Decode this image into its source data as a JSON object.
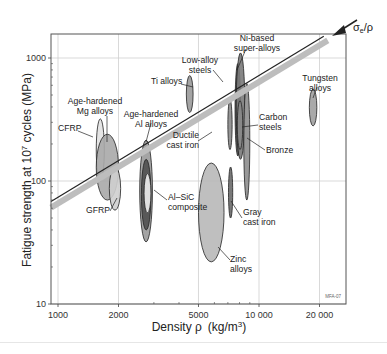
{
  "chart_data": {
    "type": "bubble-ellipse",
    "title": "",
    "xlabel": "Density ρ  (kg/m³)",
    "ylabel": "Fatigue strength at 10⁷ cycles (MPa)",
    "x_scale": "log",
    "y_scale": "log",
    "xlim": [
      900,
      26000
    ],
    "ylim": [
      10,
      1800
    ],
    "x_ticks": [
      {
        "value": 1000,
        "label": "1000"
      },
      {
        "value": 2000,
        "label": "2000"
      },
      {
        "value": 5000,
        "label": "5000"
      },
      {
        "value": 10000,
        "label": "10 000"
      },
      {
        "value": 20000,
        "label": "20 000"
      }
    ],
    "y_ticks": [
      {
        "value": 10,
        "label": "10"
      },
      {
        "value": 100,
        "label": "100"
      },
      {
        "value": 1000,
        "label": "1000"
      }
    ],
    "grid": true,
    "guide_line": {
      "label": "σe/ρ",
      "slope": 1,
      "points": [
        [
          930,
          68
        ],
        [
          21000,
          1500
        ]
      ]
    },
    "watermark": "MFA 07",
    "ellipses": [
      {
        "name": "CFRP",
        "x": [
          1550,
          1700
        ],
        "y": [
          100,
          320
        ],
        "fill": "#e2e2e2"
      },
      {
        "name": "Age-hardened Mg alloys",
        "x": [
          1550,
          2000
        ],
        "y": [
          70,
          240
        ],
        "fill": "#a8a8a8"
      },
      {
        "name": "GFRP",
        "x": [
          1800,
          2050
        ],
        "y": [
          58,
          130
        ],
        "fill": "#cfcfcf"
      },
      {
        "name": "Age-hardened Al alloys",
        "x": [
          2550,
          2950
        ],
        "y": [
          32,
          215
        ],
        "fill": "#9a9a9a"
      },
      {
        "name": "Al alloys (core)",
        "x": [
          2600,
          2900
        ],
        "y": [
          40,
          150
        ],
        "fill": "#505050"
      },
      {
        "name": "Al-SiC composite",
        "x": [
          2680,
          2900
        ],
        "y": [
          55,
          115
        ],
        "fill": "#f0f0f0"
      },
      {
        "name": "Ti alloys",
        "x": [
          4350,
          4700
        ],
        "y": [
          360,
          720
        ],
        "fill": "#9a9a9a"
      },
      {
        "name": "Zinc alloys",
        "x": [
          5000,
          6700
        ],
        "y": [
          22,
          140
        ],
        "fill": "#b8b8b8"
      },
      {
        "name": "Ductile cast iron",
        "x": [
          7000,
          7350
        ],
        "y": [
          180,
          460
        ],
        "fill": "#8a8a8a"
      },
      {
        "name": "Gray cast iron",
        "x": [
          7050,
          7400
        ],
        "y": [
          50,
          130
        ],
        "fill": "#6a6a6a"
      },
      {
        "name": "Low-alloy steels",
        "x": [
          7600,
          8100
        ],
        "y": [
          160,
          900
        ],
        "fill": "#4a4a4a"
      },
      {
        "name": "Ni-based super-alloys",
        "x": [
          7700,
          8500
        ],
        "y": [
          150,
          1100
        ],
        "fill": "#7a7a7a"
      },
      {
        "name": "Carbon steels",
        "x": [
          7800,
          8300
        ],
        "y": [
          180,
          450
        ],
        "fill": "#8a8a8a"
      },
      {
        "name": "Bronze",
        "x": [
          8400,
          9000
        ],
        "y": [
          70,
          620
        ],
        "fill": "#8e8e8e"
      },
      {
        "name": "Tungsten alloys",
        "x": [
          17800,
          19400
        ],
        "y": [
          280,
          560
        ],
        "fill": "#a0a0a0"
      }
    ],
    "annotations": [
      {
        "text": [
          "CFRP"
        ],
        "at": [
          24,
          131
        ]
      },
      {
        "text": [
          "Age-hardened",
          "Mg alloys"
        ],
        "at": [
          70,
          104
        ]
      },
      {
        "text": [
          "GFRP"
        ],
        "at": [
          90,
          218
        ]
      },
      {
        "text": [
          "Age-hardened",
          "Al alloys"
        ],
        "at": [
          125,
          117
        ]
      },
      {
        "text": [
          "Al–SiC",
          "composite"
        ],
        "at": [
          160,
          197
        ]
      },
      {
        "text": [
          "Ti alloys"
        ],
        "at": [
          155,
          84
        ]
      },
      {
        "text": [
          "Low-alloy",
          "steels"
        ],
        "at": [
          210,
          62
        ]
      },
      {
        "text": [
          "Ni-based",
          "super-alloys"
        ],
        "at": [
          253,
          46
        ]
      },
      {
        "text": [
          "Carbon",
          "steels"
        ],
        "at": [
          275,
          120
        ]
      },
      {
        "text": [
          "Ductile",
          "cast iron"
        ],
        "at": [
          28,
          134
        ]
      },
      {
        "text": [
          "Bronze"
        ],
        "at": [
          280,
          152
        ]
      },
      {
        "text": [
          "Gray",
          "cast iron"
        ],
        "at": [
          260,
          214
        ]
      },
      {
        "text": [
          "Zinc",
          "alloys"
        ],
        "at": [
          230,
          265
        ]
      },
      {
        "text": [
          "Tungsten",
          "alloys"
        ],
        "at": [
          330,
          82
        ]
      }
    ]
  },
  "axes": {
    "x_title_main": "Density ",
    "x_title_rho": "ρ",
    "x_title_units": "(kg/m",
    "x_title_sup": "3",
    "x_title_close": ")",
    "y_title_main": "Fatigue strength at 10",
    "y_title_sup": "7",
    "y_title_rest": " cycles (MPa)"
  },
  "guide_label": {
    "sigma": "σ",
    "sub": "e",
    "rest": "/ρ"
  },
  "watermark": "MFA-07"
}
